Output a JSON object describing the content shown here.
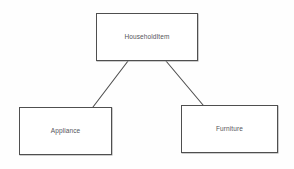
{
  "diagram": {
    "kind": "class-hierarchy-diagram",
    "background_color": "#fefefe",
    "stroke_color": "#4f4f4f",
    "text_color": "#54545a",
    "nodes": [
      {
        "id": "householditem",
        "label": "HouseholdItem",
        "role": "superclass",
        "x": 96,
        "y": 13,
        "width": 102,
        "height": 48
      },
      {
        "id": "appliance",
        "label": "Appliance",
        "role": "subclass",
        "x": 19,
        "y": 107,
        "width": 93,
        "height": 48
      },
      {
        "id": "furniture",
        "label": "Furniture",
        "role": "subclass",
        "x": 181,
        "y": 105,
        "width": 97,
        "height": 48
      }
    ],
    "edges": [
      {
        "id": "edge-householditem-appliance",
        "from": "householditem",
        "to": "appliance",
        "label": "",
        "x1": 128,
        "y1": 61,
        "x2": 93,
        "y2": 107
      },
      {
        "id": "edge-householditem-furniture",
        "from": "householditem",
        "to": "furniture",
        "label": "",
        "x1": 166,
        "y1": 61,
        "x2": 203,
        "y2": 105
      }
    ]
  }
}
